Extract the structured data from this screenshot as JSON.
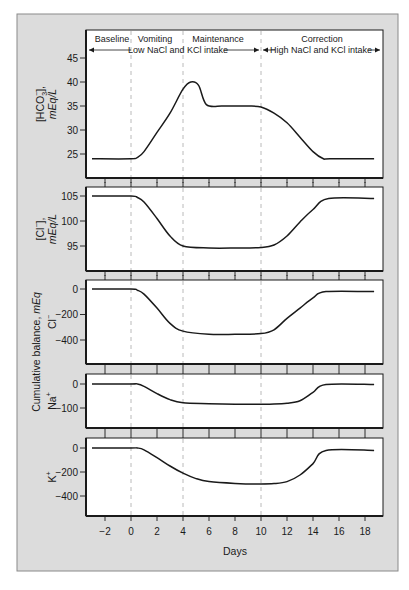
{
  "chart_data": {
    "type": "line",
    "title": "",
    "xlabel": "Days",
    "x_ticks": [
      -2,
      0,
      2,
      4,
      6,
      8,
      10,
      12,
      14,
      16,
      18
    ],
    "xlim": [
      -3.3,
      19.3
    ],
    "phases": [
      {
        "label": "Baseline",
        "start": -3.3,
        "end": 0
      },
      {
        "label": "Vomiting",
        "start": 0,
        "end": 4
      },
      {
        "label": "Maintenance",
        "start": 4,
        "end": 10
      },
      {
        "label": "Correction",
        "start": 10,
        "end": 19.3
      }
    ],
    "phase_boundaries": [
      0,
      4,
      10
    ],
    "intake_annotations": [
      {
        "label": "Low NaCl and KCl intake",
        "start": -3.3,
        "end": 10
      },
      {
        "label": "High NaCl and KCl intake",
        "start": 10,
        "end": 19.3
      }
    ],
    "shared_ylabel": "Cumulative balance, mEq",
    "panels": [
      {
        "name": "bicarbonate",
        "ylabel": "[HCO3-], mEq/L",
        "ylabel_main": "[HCO",
        "ylabel_sub": "3",
        "ylabel_sup": "−",
        "ylabel_close": "],",
        "ylabel_unit": "mEq/L",
        "y_ticks": [
          25,
          30,
          35,
          40,
          45
        ],
        "ylim": [
          21,
          50.5
        ],
        "x": [
          -3,
          0,
          0.5,
          1,
          2,
          3,
          4,
          4.6,
          5.2,
          5.8,
          7,
          8,
          9,
          10,
          11,
          12,
          13,
          14,
          14.8,
          15.3,
          18.7
        ],
        "y": [
          24,
          24,
          24.3,
          25.5,
          29.5,
          33.5,
          38.5,
          40,
          39.3,
          35.3,
          35,
          35,
          35,
          34.8,
          33.5,
          31.5,
          28.5,
          25.5,
          24,
          24,
          24
        ]
      },
      {
        "name": "chloride-concentration",
        "ylabel": "[Cl-], mEq/L",
        "ylabel_main": "[Cl",
        "ylabel_sup": "−",
        "ylabel_close": "],",
        "ylabel_unit": "mEq/L",
        "y_ticks": [
          95,
          100,
          105
        ],
        "ylim": [
          90,
          106
        ],
        "x": [
          -3,
          0,
          0.5,
          1,
          2,
          3,
          4,
          6,
          8,
          10,
          11,
          12,
          13,
          14,
          15.2,
          18.7
        ],
        "y": [
          105,
          105,
          104.7,
          103.8,
          100.5,
          97,
          95,
          94.6,
          94.6,
          94.7,
          95.2,
          97,
          99.8,
          102.3,
          104.5,
          104.5
        ]
      },
      {
        "name": "chloride-balance",
        "ylabel": "Cl-",
        "ylabel_main": "Cl",
        "ylabel_sup": "−",
        "y_ticks": [
          0,
          -200,
          -400
        ],
        "ylim": [
          -590,
          70
        ],
        "x": [
          -3,
          0,
          0.5,
          1,
          2,
          3,
          4,
          6,
          8,
          10,
          11,
          12,
          13,
          14,
          15,
          18.7
        ],
        "y": [
          0,
          0,
          -10,
          -40,
          -150,
          -270,
          -330,
          -355,
          -355,
          -350,
          -320,
          -230,
          -150,
          -70,
          -20,
          -20
        ]
      },
      {
        "name": "sodium-balance",
        "ylabel": "Na+",
        "ylabel_main": "Na",
        "ylabel_sup": "+",
        "y_ticks": [
          0,
          -100
        ],
        "ylim": [
          -185,
          40
        ],
        "x": [
          -3,
          0,
          0.5,
          1,
          2,
          3,
          4,
          6,
          8,
          10,
          11,
          12,
          13,
          14,
          15,
          18.7
        ],
        "y": [
          0,
          0,
          0,
          -10,
          -40,
          -65,
          -78,
          -82,
          -84,
          -84,
          -83,
          -80,
          -70,
          -35,
          -2,
          -2
        ]
      },
      {
        "name": "potassium-balance",
        "ylabel": "K+",
        "ylabel_main": "K",
        "ylabel_sup": "+",
        "y_ticks": [
          0,
          -200,
          -400
        ],
        "ylim": [
          -567,
          83
        ],
        "x": [
          -3,
          0,
          0.5,
          1,
          2,
          3,
          4,
          5,
          6,
          8,
          10,
          11,
          12,
          13,
          14,
          15,
          18.7
        ],
        "y": [
          0,
          0,
          0,
          -15,
          -80,
          -150,
          -210,
          -255,
          -280,
          -295,
          -300,
          -297,
          -280,
          -225,
          -130,
          -20,
          -20
        ]
      }
    ]
  }
}
